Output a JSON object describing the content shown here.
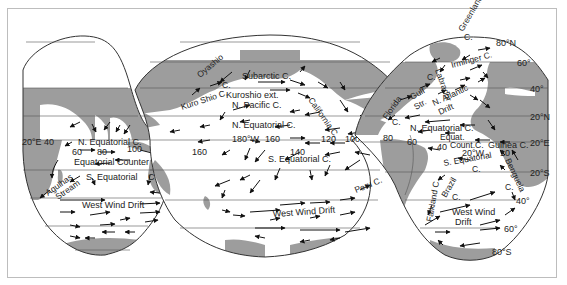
{
  "map": {
    "title": "Ocean surface currents",
    "projection": "interrupted (three lobes)",
    "colors": {
      "land": "#9d9d9d",
      "ocean": "#ffffff",
      "outline": "#333333",
      "frame": "#bdbdbd",
      "arrow": "#111111"
    },
    "latitude_labels": {
      "n80": "80°N",
      "n60": "60°",
      "n40": "40°",
      "n20": "20°N",
      "eq": "20°E",
      "s20": "20°S",
      "s40": "40°",
      "s60": "60°",
      "s80": "80°S"
    },
    "longitude_labels": {
      "indian": {
        "e20": "20°E 40",
        "e60": "60",
        "e80": "80",
        "e100": "100",
        "e120": "120",
        "e140": "140"
      },
      "pacific": {
        "e160": "160",
        "w180": "180°W",
        "w160": "160",
        "w140": "140",
        "w120": "120",
        "w100": "100"
      },
      "atlantic": {
        "w80": "80",
        "w60": "60",
        "w40": "40",
        "w20": "20°W",
        "w10": "10"
      }
    },
    "currents": {
      "indian": {
        "n_equatorial": "N. Equatorial C.",
        "equatorial_counter": "Equatorial Counter C.",
        "s_equatorial": "S. Equatorial",
        "s_equatorial_c": "C.",
        "agulhas_1": "Agulhas",
        "agulhas_2": "Stream",
        "west_wind_drift": "West Wind Drift"
      },
      "pacific": {
        "oyashio": "Oyashio",
        "oyashio_c": "C.",
        "kuro_shio": "Kuro Shio C.",
        "subarctic": "Subarctic C.",
        "kuroshio_ext": "Kuroshio ext.",
        "n_pacific": "N. Pacific C.",
        "california": "California C.",
        "n_equatorial": "N. Equatorial C.",
        "s_equatorial": "S. Equatorial C.",
        "peru": "Peru C.",
        "west_wind_drift": "West Wind Drift"
      },
      "atlantic": {
        "greenland": "Greenland",
        "greenland_c": "C.",
        "irminger": "Irminger C.",
        "labrador": "Labrador",
        "labrador_c": "C.",
        "gulf_str": "Gulf",
        "gulf_str_2": "Str.",
        "n_atlantic_1": "N. Atlantic",
        "n_atlantic_2": "Drift",
        "florida": "Florida",
        "florida_c": "C.",
        "n_equatorial": "N. Equatorial C.",
        "equat": "Equat.",
        "count_c": "Count.C.",
        "guinea": "Guinea C.",
        "s_equatorial": "S. Equatorial",
        "s_equatorial_c": "C.",
        "benguela": "Benguela",
        "benguela_c": "C.",
        "brazil": "Brazil",
        "brazil_c": "C.",
        "falkland": "Falkland C.",
        "west_wind_1": "West Wind",
        "west_wind_2": "Drift"
      }
    }
  }
}
